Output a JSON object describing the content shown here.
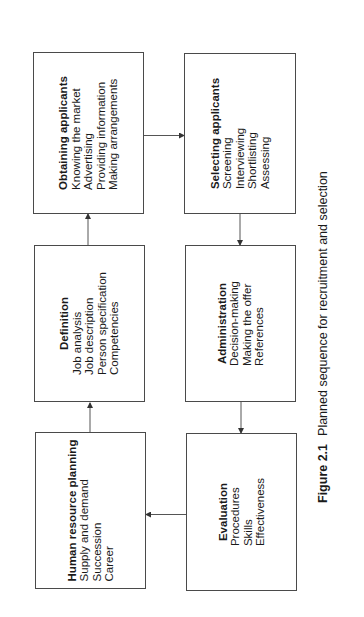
{
  "diagram": {
    "orientation": "rotated -90deg (text reads bottom-to-top)",
    "boxes": [
      {
        "id": "human-resource-planning",
        "title": "Human resource planning",
        "items": [
          "Supply and demand",
          "Succession",
          "Career"
        ]
      },
      {
        "id": "definition",
        "title": "Definition",
        "items": [
          "Job analysis",
          "Job description",
          "Person specification",
          "Competencies"
        ]
      },
      {
        "id": "obtaining-applicants",
        "title": "Obtaining applicants",
        "items": [
          "Knowing the market",
          "Advertising",
          "Providing information",
          "Making arrangements"
        ]
      },
      {
        "id": "selecting-applicants",
        "title": "Selecting applicants",
        "items": [
          "Screening",
          "Interviewing",
          "Shortlisting",
          "Assessing"
        ]
      },
      {
        "id": "administration",
        "title": "Administration",
        "items": [
          "Decision-making",
          "Making the offer",
          "References"
        ]
      },
      {
        "id": "evaluation",
        "title": "Evaluation",
        "items": [
          "Procedures",
          "Skills",
          "Effectiveness"
        ]
      }
    ],
    "flow": [
      {
        "from": "Human resource planning",
        "to": "Definition"
      },
      {
        "from": "Definition",
        "to": "Obtaining applicants"
      },
      {
        "from": "Obtaining applicants",
        "to": "Selecting applicants"
      },
      {
        "from": "Selecting applicants",
        "to": "Administration"
      },
      {
        "from": "Administration",
        "to": "Evaluation"
      },
      {
        "from": "Evaluation",
        "to": "Human resource planning"
      }
    ]
  },
  "caption": {
    "label": "Figure 2.1",
    "text": "Planned sequence for recruitment and selection"
  },
  "colors": {
    "border": "#4a4a4a",
    "text": "#1a1a1a",
    "background": "#ffffff"
  }
}
